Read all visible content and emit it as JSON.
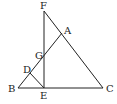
{
  "diagram": {
    "type": "geometry",
    "points": {
      "F": {
        "label": "F",
        "x": 44,
        "y": 11
      },
      "A": {
        "label": "A",
        "x": 62,
        "y": 33
      },
      "G": {
        "label": "G",
        "x": 44,
        "y": 57
      },
      "D": {
        "label": "D",
        "x": 30,
        "y": 73
      },
      "B": {
        "label": "B",
        "x": 18,
        "y": 88
      },
      "E": {
        "label": "E",
        "x": 44,
        "y": 88
      },
      "C": {
        "label": "C",
        "x": 103,
        "y": 88
      }
    },
    "segments": [
      "BC",
      "BA",
      "FC",
      "FE",
      "DE"
    ],
    "labels": [
      "F",
      "A",
      "G",
      "D",
      "B",
      "E",
      "C"
    ]
  }
}
